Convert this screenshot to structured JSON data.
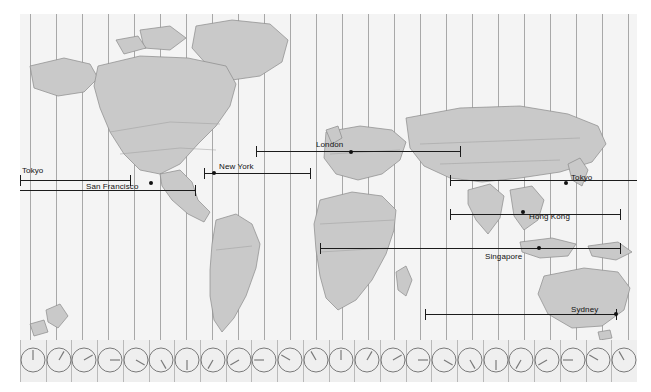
{
  "app": {
    "title": "World Time Zone Map",
    "type": "timezone-map"
  },
  "map": {
    "background_color": "#f2f2f2",
    "land_color": "#c9c9c9",
    "border_color": "#8a8a8a",
    "timezone_line_color": "#9a9a9a",
    "span_line_color": "#1b1b1b"
  },
  "cities": [
    {
      "name": "Tokyo",
      "label_x": 2,
      "label_y": 152,
      "dot_x": null,
      "dot_y": null,
      "line_y": 166,
      "line_x1": 0,
      "line_x2": 110,
      "cap_left": true,
      "cap_right": true
    },
    {
      "name": "San Francisco",
      "label_x": 66,
      "label_y": 168,
      "dot_x": 131,
      "dot_y": 169,
      "line_y": 176,
      "line_x1": 0,
      "line_x2": 175,
      "cap_left": false,
      "cap_right": true
    },
    {
      "name": "New York",
      "label_x": 199,
      "label_y": 148,
      "dot_x": 194,
      "dot_y": 159,
      "line_y": 159,
      "line_x1": 184,
      "line_x2": 290,
      "cap_left": true,
      "cap_right": true
    },
    {
      "name": "London",
      "label_x": 296,
      "label_y": 126,
      "dot_x": 331,
      "dot_y": 138,
      "line_y": 137,
      "line_x1": 236,
      "line_x2": 440,
      "cap_left": true,
      "cap_right": true
    },
    {
      "name": "Tokyo",
      "label_x": 551,
      "label_y": 159,
      "dot_x": 546,
      "dot_y": 169,
      "line_y": 166,
      "line_x1": 430,
      "line_x2": 617,
      "cap_left": true,
      "cap_right": true
    },
    {
      "name": "Hong Kong",
      "label_x": 509,
      "label_y": 198,
      "dot_x": 503,
      "dot_y": 198,
      "line_y": 200,
      "line_x1": 430,
      "line_x2": 600,
      "cap_left": true,
      "cap_right": true
    },
    {
      "name": "Singapore",
      "label_x": 465,
      "label_y": 238,
      "dot_x": 519,
      "dot_y": 234,
      "line_y": 234,
      "line_x1": 300,
      "line_x2": 600,
      "cap_left": true,
      "cap_right": true
    },
    {
      "name": "Sydney",
      "label_x": 551,
      "label_y": 291,
      "dot_x": 596,
      "dot_y": 300,
      "line_y": 300,
      "line_x1": 405,
      "line_x2": 596,
      "cap_left": true,
      "cap_right": true
    }
  ],
  "timezone_lines_x": [
    10,
    36,
    62,
    88,
    114,
    140,
    166,
    192,
    218,
    244,
    270,
    296,
    322,
    348,
    374,
    400,
    426,
    452,
    478,
    504,
    530,
    556,
    582,
    608
  ],
  "clock_strip": {
    "count": 24,
    "face_color": "#efefef",
    "hand_color": "#7a7a7a",
    "clocks": [
      {
        "hour": 12,
        "angle": 0
      },
      {
        "hour": 1,
        "angle": 30
      },
      {
        "hour": 2,
        "angle": 60
      },
      {
        "hour": 3,
        "angle": 90
      },
      {
        "hour": 4,
        "angle": 120
      },
      {
        "hour": 5,
        "angle": 150
      },
      {
        "hour": 6,
        "angle": 180
      },
      {
        "hour": 7,
        "angle": 210
      },
      {
        "hour": 8,
        "angle": 240
      },
      {
        "hour": 9,
        "angle": 270
      },
      {
        "hour": 10,
        "angle": 300
      },
      {
        "hour": 11,
        "angle": 330
      },
      {
        "hour": 12,
        "angle": 0
      },
      {
        "hour": 1,
        "angle": 30
      },
      {
        "hour": 2,
        "angle": 60
      },
      {
        "hour": 3,
        "angle": 90
      },
      {
        "hour": 4,
        "angle": 120
      },
      {
        "hour": 5,
        "angle": 150
      },
      {
        "hour": 6,
        "angle": 180
      },
      {
        "hour": 7,
        "angle": 210
      },
      {
        "hour": 8,
        "angle": 240
      },
      {
        "hour": 9,
        "angle": 270
      },
      {
        "hour": 10,
        "angle": 300
      },
      {
        "hour": 11,
        "angle": 330
      }
    ]
  }
}
